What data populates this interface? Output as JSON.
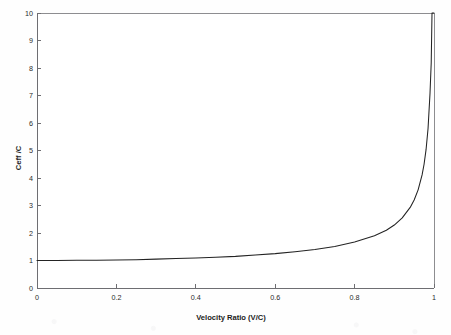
{
  "chart_data": {
    "type": "line",
    "title": "",
    "xlabel": "Velocity Ratio (V/C)",
    "ylabel": "Ceff /C",
    "xlim": [
      0,
      1
    ],
    "ylim": [
      0,
      10
    ],
    "grid": false,
    "legend": null,
    "xticks": [
      "0",
      "0.2",
      "0.4",
      "0.6",
      "0.8",
      "1"
    ],
    "xtick_values": [
      0,
      0.2,
      0.4,
      0.6,
      0.8,
      1
    ],
    "yticks": [
      "0",
      "1",
      "2",
      "3",
      "4",
      "5",
      "6",
      "7",
      "8",
      "9",
      "10"
    ],
    "ytick_values": [
      0,
      1,
      2,
      3,
      4,
      5,
      6,
      7,
      8,
      9,
      10
    ],
    "series": [
      {
        "name": "Ceff /C",
        "x": [
          0.0,
          0.05,
          0.1,
          0.15,
          0.2,
          0.25,
          0.3,
          0.35,
          0.4,
          0.45,
          0.5,
          0.55,
          0.6,
          0.65,
          0.7,
          0.75,
          0.8,
          0.85,
          0.88,
          0.9,
          0.92,
          0.94,
          0.95,
          0.96,
          0.97,
          0.975,
          0.98,
          0.985,
          0.99,
          0.993,
          0.995,
          0.9965,
          0.998,
          0.9987,
          0.9993,
          0.99975,
          1.0
        ],
        "y": [
          1.0,
          1.0,
          1.01,
          1.01,
          1.02,
          1.03,
          1.05,
          1.07,
          1.09,
          1.12,
          1.15,
          1.2,
          1.25,
          1.32,
          1.4,
          1.51,
          1.67,
          1.9,
          2.1,
          2.29,
          2.55,
          2.93,
          3.2,
          3.57,
          4.11,
          4.5,
          5.03,
          5.8,
          7.09,
          8.19,
          10.0,
          10.0,
          10.0,
          10.0,
          10.0,
          10.0,
          10.0
        ],
        "color": "#232323",
        "note": "Ceff/C = 1 / sqrt(1 - (V/C)^2); vertical asymptote at V/C = 1"
      }
    ]
  },
  "axes": {
    "y_axis_title": "Ceff /C",
    "x_axis_title": "Velocity Ratio (V/C)"
  },
  "colors": {
    "curve": "#232323",
    "frame": "#8d8d90",
    "axis": "#6e6e72",
    "text": "#1c1c1c",
    "background": "#fefefe"
  }
}
